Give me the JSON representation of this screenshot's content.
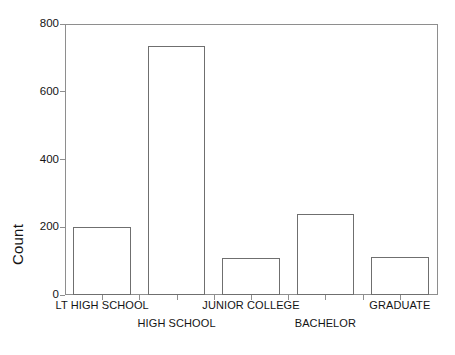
{
  "chart_data": {
    "type": "bar",
    "title": "",
    "xlabel": "",
    "ylabel": "Count",
    "categories": [
      "LT HIGH SCHOOL",
      "HIGH SCHOOL",
      "JUNIOR COLLEGE",
      "BACHELOR",
      "GRADUATE"
    ],
    "values": [
      200,
      735,
      110,
      240,
      112
    ],
    "ylim": [
      0,
      800
    ],
    "yticks": [
      0,
      200,
      400,
      600,
      800
    ],
    "ytick_labels": [
      "0",
      "200",
      "400",
      "600",
      "800"
    ],
    "grid": false,
    "legend": null,
    "bar_fill": "#ffffff",
    "bar_edge": "#6f6f6f",
    "axis_color": "#8e8e8e",
    "background": "#ffffff",
    "label_rows": [
      0,
      1,
      0,
      1,
      0
    ]
  },
  "axis": {
    "y_title": "Count"
  }
}
